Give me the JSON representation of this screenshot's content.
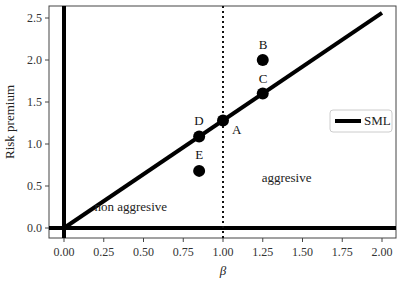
{
  "chart_data": {
    "type": "line",
    "title": "",
    "xlabel": "β",
    "ylabel": "Risk premium",
    "xlim": [
      -0.1,
      2.1
    ],
    "ylim": [
      -0.12,
      2.62
    ],
    "xticks": [
      "0.00",
      "0.25",
      "0.50",
      "0.75",
      "1.00",
      "1.25",
      "1.50",
      "1.75",
      "2.00"
    ],
    "yticks": [
      "0.0",
      "0.5",
      "1.0",
      "1.5",
      "2.0",
      "2.5"
    ],
    "grid": false,
    "legend": {
      "position": "right",
      "entries": [
        "SML"
      ]
    },
    "series": [
      {
        "name": "SML",
        "type": "line",
        "x": [
          0.0,
          2.0
        ],
        "y": [
          0.0,
          2.56
        ]
      }
    ],
    "points": [
      {
        "label": "A",
        "x": 1.0,
        "y": 1.28
      },
      {
        "label": "B",
        "x": 1.25,
        "y": 2.0
      },
      {
        "label": "C",
        "x": 1.25,
        "y": 1.6
      },
      {
        "label": "D",
        "x": 0.85,
        "y": 1.09
      },
      {
        "label": "E",
        "x": 0.85,
        "y": 0.68
      }
    ],
    "reference_lines": [
      {
        "orientation": "vertical",
        "x": 0.0,
        "style": "solid"
      },
      {
        "orientation": "horizontal",
        "y": 0.0,
        "style": "solid"
      },
      {
        "orientation": "vertical",
        "x": 1.0,
        "style": "dotted"
      }
    ],
    "annotations": [
      {
        "text": "non aggresive",
        "x": 0.42,
        "y": 0.2
      },
      {
        "text": "aggresive",
        "x": 1.4,
        "y": 0.55
      }
    ]
  }
}
